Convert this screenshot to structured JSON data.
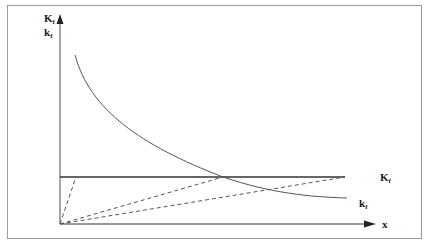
{
  "diagram": {
    "y_axis": {
      "label_upper": "K",
      "label_upper_sub": "f",
      "label_lower": "k",
      "label_lower_sub": "f"
    },
    "x_axis": {
      "label": "x"
    },
    "curves": [
      {
        "name": "K_f",
        "label": "K",
        "sub": "f",
        "type": "horizontal-line"
      },
      {
        "name": "k_f",
        "label": "k",
        "sub": "f",
        "type": "decreasing-curve"
      }
    ],
    "dashed_rays": 3,
    "colors": {
      "line": "#333333",
      "curve": "#555555",
      "frame": "#9a9a9a"
    }
  }
}
